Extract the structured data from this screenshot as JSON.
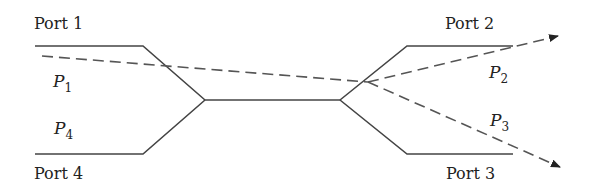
{
  "diagram": {
    "type": "directional-coupler",
    "colors": {
      "stroke": "#444444",
      "dashed": "#555555",
      "text": "#222222"
    },
    "ports": [
      {
        "id": "port1",
        "label": "Port 1"
      },
      {
        "id": "port2",
        "label": "Port 2"
      },
      {
        "id": "port3",
        "label": "Port 3"
      },
      {
        "id": "port4",
        "label": "Port 4"
      }
    ],
    "powers": [
      {
        "id": "P1",
        "symbol": "P",
        "sub": "1"
      },
      {
        "id": "P2",
        "symbol": "P",
        "sub": "2"
      },
      {
        "id": "P3",
        "symbol": "P",
        "sub": "3"
      },
      {
        "id": "P4",
        "symbol": "P",
        "sub": "4"
      }
    ]
  }
}
